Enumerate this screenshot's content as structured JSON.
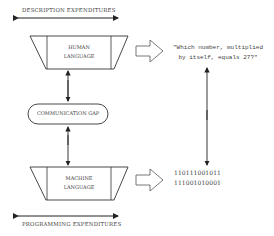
{
  "diagram": {
    "top_label": "DESCRIPTION EXPENDITURES",
    "bottom_label": "PROGRAMMING EXPENDITURES",
    "human_box": {
      "line1": "HUMAN",
      "line2": "LANGUAGE"
    },
    "gap_box": {
      "label": "COMMUNICATION GAP"
    },
    "machine_box": {
      "line1": "MACHINE",
      "line2": "LANGUAGE"
    },
    "human_example": {
      "line1": "\"Which number, multiplied",
      "line2": "by itself, equals 27?\""
    },
    "machine_example": {
      "line1": "110111001011",
      "line2": "111001010001"
    }
  }
}
